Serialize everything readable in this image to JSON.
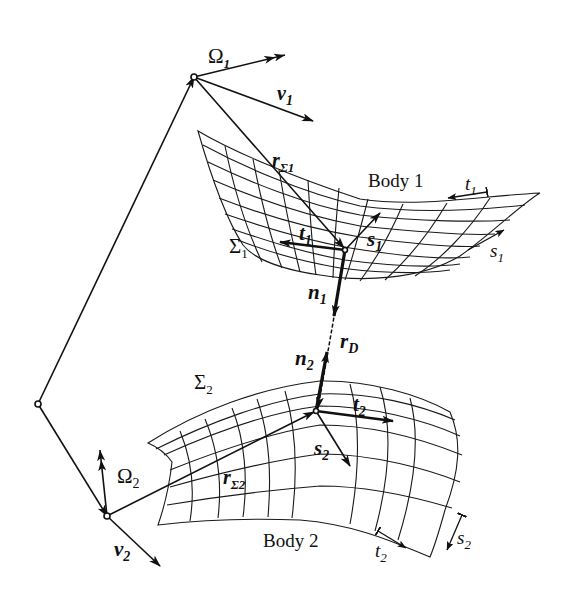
{
  "diagram": {
    "colors": {
      "ink": "#111111",
      "background": "#ffffff"
    },
    "labels": {
      "omega1": {
        "base": "Ω",
        "sub": "1"
      },
      "v1": {
        "base": "v",
        "sub": "1"
      },
      "r_sigma1": {
        "base": "r",
        "sub": "Σ1"
      },
      "body1": "Body  1",
      "t1_edge": {
        "base": "t",
        "sub": "1"
      },
      "s1_edge": {
        "base": "s",
        "sub": "1"
      },
      "sigma1": {
        "base": "Σ",
        "sub": "1"
      },
      "t1": {
        "base": "t",
        "sub": "1"
      },
      "s1": {
        "base": "s",
        "sub": "1"
      },
      "n1": {
        "base": "n",
        "sub": "1"
      },
      "rD": {
        "base": "r",
        "sub": "D"
      },
      "n2": {
        "base": "n",
        "sub": "2"
      },
      "sigma2": {
        "base": "Σ",
        "sub": "2"
      },
      "t2": {
        "base": "t",
        "sub": "2"
      },
      "s2": {
        "base": "s",
        "sub": "2"
      },
      "omega2": {
        "base": "Ω",
        "sub": "2"
      },
      "r_sigma2": {
        "base": "r",
        "sub": "Σ2"
      },
      "v2": {
        "base": "v",
        "sub": "2"
      },
      "body2": "Body  2",
      "t2_edge": {
        "base": "t",
        "sub": "2"
      },
      "s2_edge": {
        "base": "s",
        "sub": "2"
      }
    },
    "nodes": [
      {
        "id": "origin",
        "x": 38,
        "y": 404
      },
      {
        "id": "body1-ref",
        "x": 194,
        "y": 77
      },
      {
        "id": "body2-ref",
        "x": 107,
        "y": 516
      },
      {
        "id": "contact1",
        "x": 345,
        "y": 250
      },
      {
        "id": "contact2",
        "x": 316,
        "y": 411
      }
    ],
    "vectors": [
      {
        "id": "origin-to-body1",
        "from": "origin",
        "to": "body1-ref"
      },
      {
        "id": "origin-to-body2",
        "from": "origin",
        "to": "body2-ref"
      },
      {
        "id": "omega1",
        "from": "body1-ref",
        "to": [
          285,
          55
        ]
      },
      {
        "id": "v1",
        "from": "body1-ref",
        "to": [
          313,
          121
        ]
      },
      {
        "id": "r_sigma1",
        "from": "body1-ref",
        "to": "contact1"
      },
      {
        "id": "t1",
        "from": "contact1",
        "to": [
          280,
          242
        ]
      },
      {
        "id": "s1",
        "from": "contact1",
        "to": [
          380,
          213
        ]
      },
      {
        "id": "n1",
        "from": "contact1",
        "to": [
          334,
          315
        ]
      },
      {
        "id": "rD",
        "from": "contact1",
        "to": "contact2",
        "style": "dashed"
      },
      {
        "id": "n2",
        "from": "contact2",
        "to": [
          326,
          353
        ]
      },
      {
        "id": "t2",
        "from": "contact2",
        "to": [
          392,
          423
        ]
      },
      {
        "id": "s2",
        "from": "contact2",
        "to": [
          350,
          466
        ]
      },
      {
        "id": "omega2",
        "from": "body2-ref",
        "to": [
          100,
          450
        ]
      },
      {
        "id": "r_sigma2",
        "from": "body2-ref",
        "to": "contact2"
      },
      {
        "id": "v2",
        "from": "body2-ref",
        "to": [
          160,
          566
        ]
      }
    ]
  }
}
